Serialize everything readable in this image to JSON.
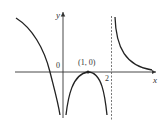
{
  "figure": {
    "axes": {
      "x_label": "x",
      "y_label": "y",
      "origin_label": "0"
    },
    "annotations": {
      "point_label": "(1, 0)",
      "asymptote_label": "2"
    },
    "colors": {
      "curve": "#222222",
      "axis": "#333333",
      "asymptote": "#555555"
    }
  }
}
